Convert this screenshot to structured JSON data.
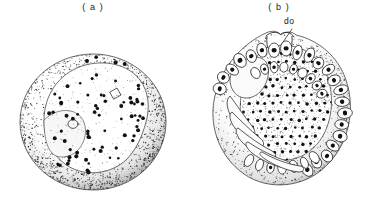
{
  "figure": {
    "background_color": "#ffffff",
    "ink_color": "#111111",
    "type": "scientific-line-drawing",
    "panels": [
      {
        "id": "a",
        "caption": "( a )",
        "subject": "earlier-stage embryo",
        "features": [
          "outer spherical chorion with stippled shading",
          "pale crescent-shaped germ band region",
          "scattered dark nuclei / cells"
        ]
      },
      {
        "id": "b",
        "caption": "( b )",
        "subject": "later-stage embryo",
        "features": [
          "dorsal organ notch at top",
          "ring of rounded yolk cells along right and lower rim",
          "elongate limb buds at lower left",
          "densely stippled central germ disc with dark nuclei"
        ],
        "callouts": [
          {
            "id": "do",
            "label": "do",
            "meaning": "dorsal organ"
          }
        ]
      }
    ]
  }
}
